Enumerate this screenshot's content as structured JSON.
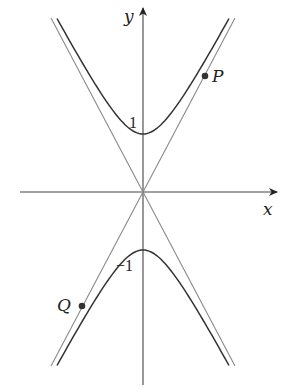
{
  "diagram": {
    "type": "hyperbola-with-asymptotes",
    "equation": "y^2 - x^2/b^2 = 1",
    "axes": {
      "x_label": "x",
      "y_label": "y"
    },
    "tick_labels": {
      "upper_vertex": "1",
      "lower_vertex": "−1"
    },
    "points": [
      {
        "label": "P",
        "branch": "upper",
        "side": "right"
      },
      {
        "label": "Q",
        "branch": "lower",
        "side": "left"
      }
    ],
    "colors": {
      "curve": "#333333",
      "asymptote": "#8a8a8a",
      "axis": "#444444",
      "point": "#333333"
    }
  }
}
